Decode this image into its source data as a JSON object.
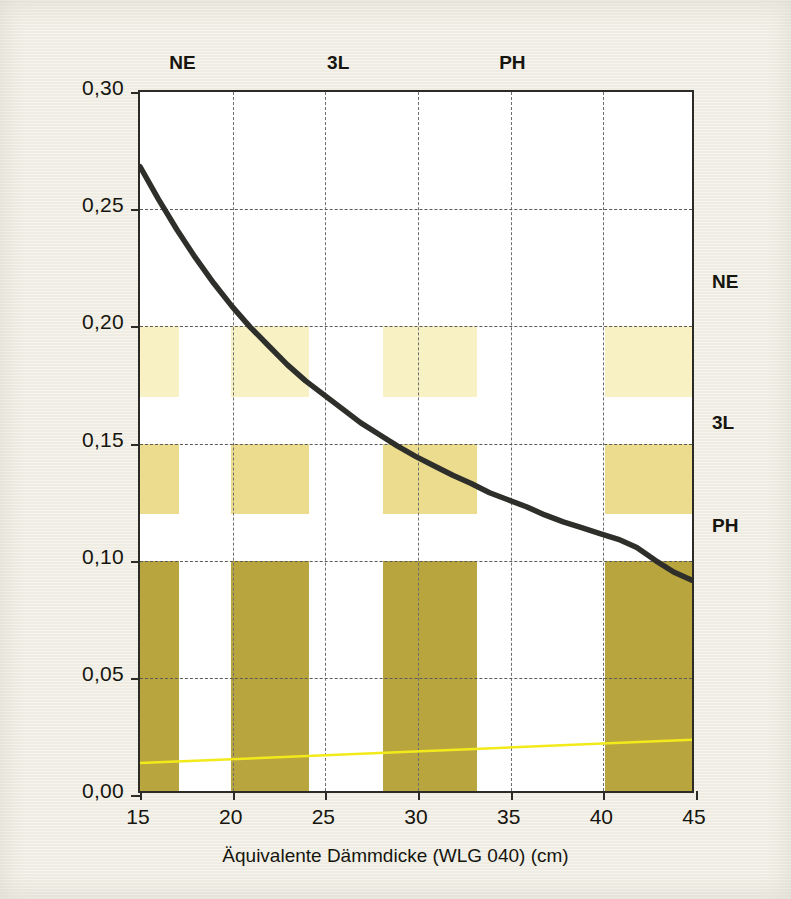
{
  "chart_data": {
    "type": "line",
    "title": "",
    "xlabel": "Äquivalente Dämmdicke (WLG 040) (cm)",
    "ylabel": "U-Wert (W/m²K)",
    "xlim": [
      15,
      45
    ],
    "ylim": [
      0.0,
      0.3
    ],
    "grid": true,
    "legend_position": "none",
    "x_ticks": [
      "15",
      "20",
      "25",
      "30",
      "35",
      "40",
      "45"
    ],
    "x_tick_values": [
      15,
      20,
      25,
      30,
      35,
      40,
      45
    ],
    "y_ticks": [
      "0,00",
      "0,05",
      "0,10",
      "0,15",
      "0,20",
      "0,25",
      "0,30"
    ],
    "y_tick_values": [
      0.0,
      0.05,
      0.1,
      0.15,
      0.2,
      0.25,
      0.3
    ],
    "series": [
      {
        "name": "U-Wert",
        "type": "line",
        "color": "#2e2e2b",
        "x": [
          15,
          16,
          17,
          18,
          19,
          20,
          21,
          22,
          23,
          24,
          25,
          26,
          27,
          28,
          29,
          30,
          31,
          32,
          33,
          34,
          35,
          36,
          37,
          38,
          39,
          40,
          41,
          42,
          43,
          44,
          45
        ],
        "values": [
          0.268,
          0.254,
          0.241,
          0.229,
          0.218,
          0.208,
          0.199,
          0.191,
          0.183,
          0.176,
          0.17,
          0.164,
          0.158,
          0.153,
          0.148,
          0.1435,
          0.1395,
          0.1355,
          0.132,
          0.128,
          0.125,
          0.122,
          0.1185,
          0.1155,
          0.113,
          0.1105,
          0.108,
          0.1045,
          0.099,
          0.094,
          0.0905
        ]
      },
      {
        "name": "Zusatzlinie",
        "type": "line",
        "color": "#f2ea1a",
        "x": [
          15,
          45
        ],
        "values": [
          0.012,
          0.022
        ]
      }
    ],
    "bands": [
      {
        "name": "NE",
        "label": "NE",
        "color": "#f7f1c4",
        "y_from": 0.17,
        "y_to": 0.2
      },
      {
        "name": "3L",
        "label": "3L",
        "color": "#ecdc8d",
        "y_from": 0.12,
        "y_to": 0.15
      },
      {
        "name": "PH",
        "label": "PH",
        "color": "#b8a53e",
        "y_from": 0.0,
        "y_to": 0.1
      }
    ],
    "band_columns": [
      {
        "x_from": 15.0,
        "x_to": 17.1
      },
      {
        "x_from": 19.9,
        "x_to": 24.1
      },
      {
        "x_from": 28.1,
        "x_to": 33.2
      },
      {
        "x_from": 40.1,
        "x_to": 45.0
      }
    ],
    "top_labels": [
      {
        "text": "NE",
        "x": 17.4
      },
      {
        "text": "3L",
        "x": 25.8
      },
      {
        "text": "PH",
        "x": 35.2
      }
    ],
    "right_labels": [
      {
        "text": "NE",
        "y": 0.217
      },
      {
        "text": "3L",
        "y": 0.157
      },
      {
        "text": "PH",
        "y": 0.113
      }
    ]
  },
  "colors": {
    "paper": "#f2f0e6",
    "plot_background": "#ffffff",
    "axis": "#2b2b28",
    "grid": "#5a5a5a",
    "curve": "#2e2e2b",
    "band_ne": "#f7f1c4",
    "band_3l": "#ecdc8d",
    "band_ph": "#b8a53e",
    "thin_line": "#f2ea1a",
    "text": "#16150f"
  }
}
